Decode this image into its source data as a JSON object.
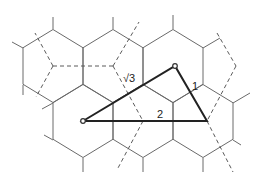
{
  "diagram": {
    "colors": {
      "hex_edge": "#6a6a6a",
      "dashed": "#5a5a5a",
      "triangle": "#222222",
      "background": "#ffffff"
    },
    "hex": {
      "half_width": 30,
      "radius": 36.5
    },
    "hex_centers": [
      [
        53,
        66
      ],
      [
        113,
        66
      ],
      [
        173,
        66
      ],
      [
        83,
        121
      ],
      [
        143,
        121
      ],
      [
        203,
        121
      ]
    ],
    "stubs": [
      [
        [
          53,
          29
        ],
        [
          53,
          17
        ]
      ],
      [
        [
          23,
          48
        ],
        [
          12,
          42
        ]
      ],
      [
        [
          113,
          29
        ],
        [
          113,
          17
        ]
      ],
      [
        [
          173,
          29
        ],
        [
          173,
          15
        ]
      ],
      [
        [
          203,
          48
        ],
        [
          220,
          38
        ]
      ],
      [
        [
          23,
          85
        ],
        [
          23,
          95
        ]
      ],
      [
        [
          53,
          103
        ],
        [
          42,
          109
        ]
      ],
      [
        [
          233,
          103
        ],
        [
          250,
          93
        ]
      ],
      [
        [
          53,
          140
        ],
        [
          44,
          135
        ]
      ],
      [
        [
          83,
          158
        ],
        [
          83,
          172
        ]
      ],
      [
        [
          143,
          158
        ],
        [
          143,
          172
        ]
      ],
      [
        [
          203,
          158
        ],
        [
          203,
          172
        ]
      ],
      [
        [
          233,
          140
        ],
        [
          241,
          145
        ]
      ]
    ],
    "dashed_segments": [
      [
        [
          53,
          66
        ],
        [
          113,
          66
        ]
      ],
      [
        [
          53,
          66
        ],
        [
          35,
          33
        ]
      ],
      [
        [
          53,
          66
        ],
        [
          36,
          97
        ]
      ],
      [
        [
          113,
          66
        ],
        [
          139,
          22
        ]
      ],
      [
        [
          113,
          66
        ],
        [
          143,
          121
        ]
      ],
      [
        [
          143,
          121
        ],
        [
          118,
          168
        ]
      ],
      [
        [
          217,
          33
        ],
        [
          236,
          66
        ]
      ],
      [
        [
          236,
          66
        ],
        [
          207,
          121
        ]
      ],
      [
        [
          207,
          121
        ],
        [
          233,
          172
        ]
      ]
    ],
    "triangle": {
      "points": [
        [
          83,
          121
        ],
        [
          175,
          66
        ],
        [
          207,
          121
        ]
      ],
      "vertex_markers": [
        [
          83,
          121
        ],
        [
          175,
          66
        ]
      ]
    },
    "labels": [
      {
        "text": "√3",
        "x": 123,
        "y": 82
      },
      {
        "text": "1",
        "x": 192,
        "y": 90
      },
      {
        "text": "2",
        "x": 157,
        "y": 118
      }
    ]
  }
}
